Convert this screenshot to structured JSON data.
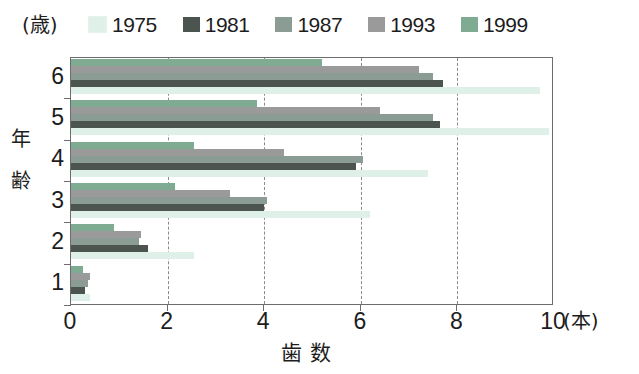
{
  "legend": {
    "position": "top",
    "entries": [
      {
        "label": "1975",
        "color": "#dff0e8"
      },
      {
        "label": "1981",
        "color": "#4c5450"
      },
      {
        "label": "1987",
        "color": "#8a9c93"
      },
      {
        "label": "1993",
        "color": "#9a9a9a"
      },
      {
        "label": "1999",
        "color": "#7eab92"
      }
    ]
  },
  "axes": {
    "y_unit": "(歳)",
    "y_title_chars": [
      "年",
      "齢"
    ],
    "x_unit": "(本)",
    "x_title": "歯数",
    "y_tick_labels": [
      "6",
      "5",
      "4",
      "3",
      "2",
      "1"
    ],
    "x_tick_labels": [
      "0",
      "2",
      "4",
      "6",
      "8",
      "10"
    ]
  },
  "chart_data": {
    "type": "bar",
    "orientation": "horizontal",
    "title": "",
    "subtitle": "",
    "xlabel": "歯数 (本)",
    "ylabel": "年齢 (歳)",
    "xlim": [
      0,
      10
    ],
    "xticks": [
      0,
      2,
      4,
      6,
      8,
      10
    ],
    "grid": "vertical-dashed",
    "legend_position": "top",
    "categories": [
      "1",
      "2",
      "3",
      "4",
      "5",
      "6"
    ],
    "category_order_top_to_bottom": [
      "6",
      "5",
      "4",
      "3",
      "2",
      "1"
    ],
    "series_order_within_group_top_to_bottom": [
      "1999",
      "1993",
      "1987",
      "1981",
      "1975"
    ],
    "series": [
      {
        "name": "1975",
        "color": "#dff0e8",
        "values": [
          0.4,
          2.55,
          6.2,
          7.4,
          9.9,
          9.7
        ]
      },
      {
        "name": "1981",
        "color": "#4c5450",
        "values": [
          0.3,
          1.6,
          4.0,
          5.9,
          7.65,
          7.7
        ]
      },
      {
        "name": "1987",
        "color": "#8a9c93",
        "values": [
          0.35,
          1.4,
          4.05,
          6.05,
          7.5,
          7.5
        ]
      },
      {
        "name": "1993",
        "color": "#9a9a9a",
        "values": [
          0.4,
          1.45,
          3.3,
          4.4,
          6.4,
          7.2
        ]
      },
      {
        "name": "1999",
        "color": "#7eab92",
        "values": [
          0.25,
          0.9,
          2.15,
          2.55,
          3.85,
          5.2
        ]
      }
    ]
  }
}
